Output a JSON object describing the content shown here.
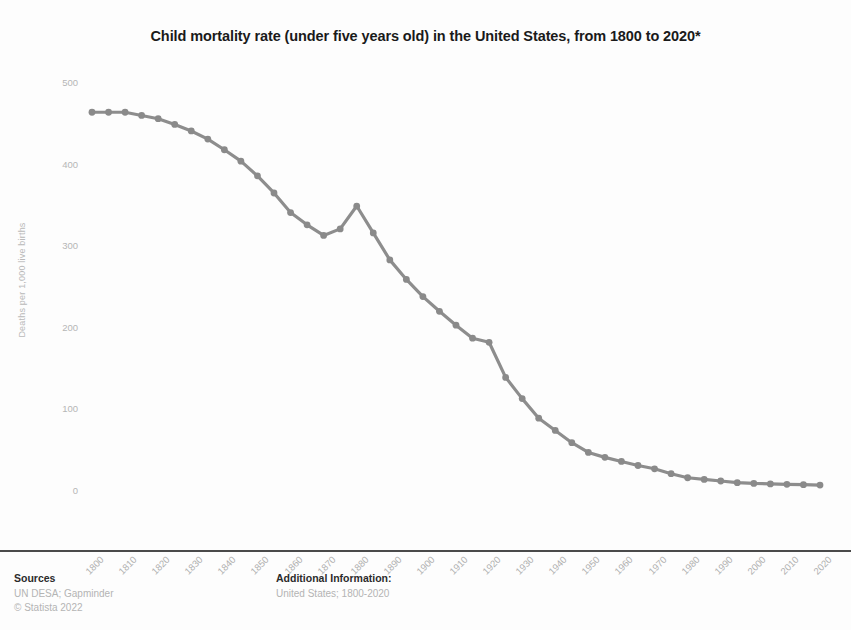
{
  "chart_data": {
    "type": "line",
    "title": "Child mortality rate (under five years old) in the United States, from 1800 to 2020*",
    "xlabel": "",
    "ylabel": "Deaths per 1,000 live births",
    "ylim": [
      0,
      500
    ],
    "xlim": [
      1800,
      2020
    ],
    "grid": false,
    "legend": "none",
    "series_color": "#8d8d8d",
    "y_ticks": [
      500,
      400,
      300,
      200,
      100,
      0
    ],
    "x_ticks": [
      "1800",
      "1810",
      "1820",
      "1830",
      "1840",
      "1850",
      "1860",
      "1870",
      "1880",
      "1890",
      "1900",
      "1910",
      "1920",
      "1930",
      "1940",
      "1950",
      "1960",
      "1970",
      "1980",
      "1990",
      "2000",
      "2010",
      "2020"
    ],
    "x": [
      1800,
      1805,
      1810,
      1815,
      1820,
      1825,
      1830,
      1835,
      1840,
      1845,
      1850,
      1855,
      1860,
      1865,
      1870,
      1875,
      1880,
      1885,
      1890,
      1895,
      1900,
      1905,
      1910,
      1915,
      1920,
      1925,
      1930,
      1935,
      1940,
      1945,
      1950,
      1955,
      1960,
      1965,
      1970,
      1975,
      1980,
      1985,
      1990,
      1995,
      2000,
      2005,
      2010,
      2015,
      2020
    ],
    "values": [
      462.9,
      462.9,
      462.9,
      459.0,
      455.0,
      448.0,
      440.0,
      430.0,
      417.0,
      403.0,
      385.0,
      364.0,
      340.0,
      325.0,
      312.0,
      320.0,
      348.0,
      315.0,
      282.0,
      258.0,
      237.0,
      219.0,
      202.0,
      186.0,
      181.0,
      138.0,
      112.0,
      88.0,
      73.0,
      58.0,
      46.0,
      40.0,
      35.0,
      30.0,
      26.0,
      20.0,
      15.0,
      13.0,
      11.0,
      9.0,
      8.0,
      7.5,
      7.0,
      6.5,
      6.0
    ]
  },
  "footer": {
    "sources_heading": "Sources",
    "sources_lines": [
      "UN DESA; Gapminder",
      "© Statista 2022"
    ],
    "additional_heading": "Additional Information:",
    "additional_lines": [
      "United States; 1800-2020"
    ]
  }
}
